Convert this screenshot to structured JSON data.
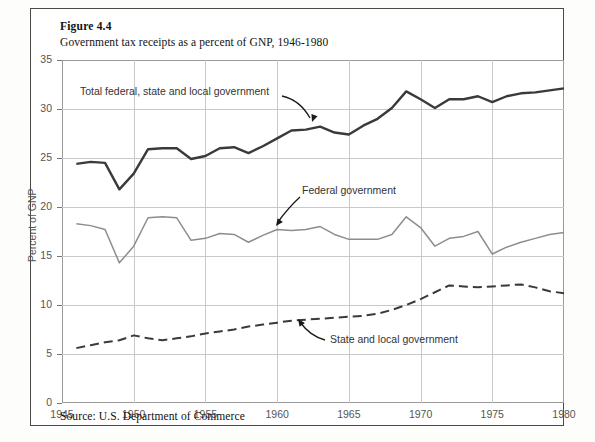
{
  "figure": {
    "number_label": "Figure 4.4",
    "title": "Government tax receipts as a percent of GNP, 1946-1980",
    "source": "Source: U.S. Department of Commerce"
  },
  "colors": {
    "total_line": "#3a3a3a",
    "federal_line": "#8d8d8d",
    "state_local_line": "#3a3a3a",
    "grid": "#c9c9c9",
    "frame": "#4a4a4a",
    "text": "#111111",
    "tick_text": "#555555"
  },
  "annotations": [
    {
      "name": "total-label",
      "text": "Total federal, state and local government"
    },
    {
      "name": "federal-label",
      "text": "Federal government"
    },
    {
      "name": "state-local-label",
      "text": "State and local government"
    }
  ],
  "chart_data": {
    "type": "line",
    "title": "Government tax receipts as a percent of GNP, 1946-1980",
    "xlabel": "",
    "ylabel": "Percent of GNP",
    "xlim": [
      1945,
      1980
    ],
    "ylim": [
      0,
      35
    ],
    "yticks": [
      0,
      5,
      10,
      15,
      20,
      25,
      30,
      35
    ],
    "xticks": [
      1945,
      1950,
      1955,
      1960,
      1965,
      1970,
      1975,
      1980
    ],
    "grid": true,
    "legend_position": "inline-annotations",
    "x": [
      1946,
      1947,
      1948,
      1949,
      1950,
      1951,
      1952,
      1953,
      1954,
      1955,
      1956,
      1957,
      1958,
      1959,
      1960,
      1961,
      1962,
      1963,
      1964,
      1965,
      1966,
      1967,
      1968,
      1969,
      1970,
      1971,
      1972,
      1973,
      1974,
      1975,
      1976,
      1977,
      1978,
      1979,
      1980
    ],
    "series": [
      {
        "name": "Total federal, state and local government",
        "style": "solid",
        "color": "#3a3a3a",
        "width": 2.4,
        "values": [
          24.4,
          24.6,
          24.5,
          21.8,
          23.4,
          25.9,
          26.0,
          26.0,
          24.9,
          25.2,
          26.0,
          26.1,
          25.5,
          26.2,
          27.0,
          27.8,
          27.9,
          28.2,
          27.6,
          27.4,
          28.3,
          29.0,
          30.1,
          31.8,
          31.0,
          30.1,
          31.0,
          31.0,
          31.3,
          30.7,
          31.3,
          31.6,
          31.7,
          31.9,
          32.1
        ]
      },
      {
        "name": "Federal government",
        "style": "solid",
        "color": "#8d8d8d",
        "width": 1.5,
        "values": [
          18.3,
          18.1,
          17.7,
          14.3,
          16.0,
          18.9,
          19.0,
          18.9,
          16.6,
          16.8,
          17.3,
          17.2,
          16.4,
          17.1,
          17.7,
          17.6,
          17.7,
          18.0,
          17.2,
          16.7,
          16.7,
          16.7,
          17.2,
          19.0,
          17.9,
          16.0,
          16.8,
          17.0,
          17.5,
          15.2,
          15.9,
          16.4,
          16.8,
          17.2,
          17.4
        ]
      },
      {
        "name": "State and local government",
        "style": "dashed",
        "color": "#3a3a3a",
        "width": 2.0,
        "values": [
          5.6,
          5.9,
          6.2,
          6.4,
          6.9,
          6.6,
          6.4,
          6.6,
          6.8,
          7.1,
          7.3,
          7.5,
          7.8,
          8.0,
          8.2,
          8.4,
          8.5,
          8.6,
          8.7,
          8.8,
          8.9,
          9.1,
          9.5,
          10.0,
          10.6,
          11.3,
          12.0,
          11.9,
          11.8,
          11.9,
          12.0,
          12.1,
          11.8,
          11.4,
          11.2
        ]
      }
    ]
  }
}
